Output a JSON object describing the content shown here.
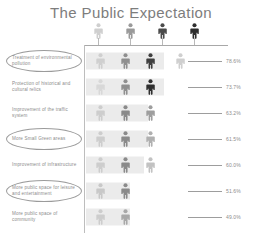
{
  "title": "The Public Expectation",
  "chart_data": {
    "type": "bar",
    "title": "The Public Expectation",
    "xlabel": "",
    "ylabel": "",
    "orientation": "horizontal",
    "grid": false,
    "legend": "none",
    "xlim": [
      0,
      100
    ],
    "value_suffix": "%",
    "categories": [
      "Treatment of environmental pollution",
      "Protection of historical and cultural relics",
      "Improvement of the traffic system",
      "More Small Green areas",
      "Improvement of infrastructure",
      "More public space for leisure and entertainment",
      "More public space of community"
    ],
    "values": [
      78.6,
      73.7,
      63.2,
      61.5,
      60.0,
      51.6,
      49.0
    ],
    "value_labels": [
      "78.6%",
      "73.7%",
      "63.2%",
      "61.5%",
      "60.0%",
      "51.6%",
      "49.0%"
    ],
    "highlighted_categories": [
      "Treatment of environmental pollution",
      "More Small Green areas",
      "More public space for leisure and entertainment"
    ],
    "scale_figures": 4,
    "scale_colors": [
      "#cfcfcf",
      "#9a9a9a",
      "#4a4a4a",
      "#2e2e2e"
    ],
    "bar_color": "#ebebeb",
    "axis_color": "#a8a8a8",
    "text_color": "#8d8d8d"
  },
  "rows": [
    {
      "label": "Treatment of environmental pollution",
      "value_label": "78.6%",
      "bar_width": 78,
      "highlighted": true,
      "figures": [
        {
          "x": 10,
          "color": "#cfcfcf"
        },
        {
          "x": 35,
          "color": "#8f8f8f"
        },
        {
          "x": 60,
          "color": "#3f3f3f"
        },
        {
          "x": 90,
          "color": "#cfcfcf"
        }
      ]
    },
    {
      "label": "Protection of historical and cultural relics",
      "value_label": "73.7%",
      "bar_width": 78,
      "highlighted": false,
      "figures": [
        {
          "x": 10,
          "color": "#d8d8d8"
        },
        {
          "x": 35,
          "color": "#8f8f8f"
        },
        {
          "x": 60,
          "color": "#2f2f2f"
        }
      ]
    },
    {
      "label": "Improvement of the traffic system",
      "value_label": "63.2%",
      "bar_width": 62,
      "highlighted": false,
      "figures": [
        {
          "x": 10,
          "color": "#cdcdcd"
        },
        {
          "x": 35,
          "color": "#8a8a8a"
        },
        {
          "x": 60,
          "color": "#9e9e9e"
        }
      ]
    },
    {
      "label": "More Small Green areas",
      "value_label": "61.5%",
      "bar_width": 62,
      "highlighted": true,
      "figures": [
        {
          "x": 10,
          "color": "#cdcdcd"
        },
        {
          "x": 35,
          "color": "#8a8a8a"
        },
        {
          "x": 60,
          "color": "#b0b0b0"
        }
      ]
    },
    {
      "label": "Improvement of infrastructure",
      "value_label": "60.0%",
      "bar_width": 58,
      "highlighted": false,
      "figures": [
        {
          "x": 10,
          "color": "#cdcdcd"
        },
        {
          "x": 35,
          "color": "#8a8a8a"
        },
        {
          "x": 60,
          "color": "#c2c2c2"
        }
      ]
    },
    {
      "label": "More public space for leisure and entertainment",
      "value_label": "51.6%",
      "bar_width": 44,
      "highlighted": true,
      "figures": [
        {
          "x": 10,
          "color": "#c8c8c8"
        },
        {
          "x": 35,
          "color": "#8a8a8a"
        }
      ]
    },
    {
      "label": "More public space of community",
      "value_label": "49.0%",
      "bar_width": 44,
      "highlighted": false,
      "figures": [
        {
          "x": 10,
          "color": "#cdcdcd"
        },
        {
          "x": 35,
          "color": "#a8a8a8"
        }
      ]
    }
  ],
  "scale": {
    "figures": [
      {
        "x": 6,
        "color": "#cfcfcf"
      },
      {
        "x": 38,
        "color": "#9a9a9a"
      },
      {
        "x": 70,
        "color": "#4a4a4a"
      },
      {
        "x": 102,
        "color": "#2e2e2e"
      }
    ]
  }
}
